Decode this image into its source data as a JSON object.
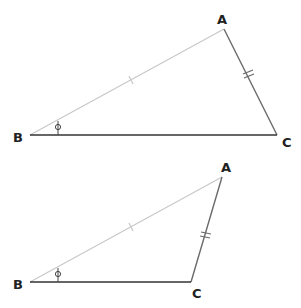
{
  "diagram": {
    "triangles": [
      {
        "id": "top",
        "labels": {
          "A": "A",
          "B": "B",
          "C": "C"
        },
        "angle_label": "ϕ",
        "points": {
          "A": [
            224,
            29
          ],
          "B": [
            30,
            135
          ],
          "C": [
            277,
            135
          ]
        },
        "side_marks": {
          "BA": "single tick",
          "AC": "double tick"
        }
      },
      {
        "id": "bottom",
        "labels": {
          "A": "A",
          "B": "B",
          "C": "C"
        },
        "angle_label": "ϕ",
        "points": {
          "A": [
            222,
            177
          ],
          "B": [
            30,
            282
          ],
          "C": [
            191,
            282
          ]
        },
        "side_marks": {
          "BA": "single tick",
          "AC": "double tick"
        }
      }
    ],
    "colors": {
      "BA": "#c8c8c8",
      "AC": "#6a6a6a",
      "BC": "#333333",
      "text": "#222222"
    }
  }
}
